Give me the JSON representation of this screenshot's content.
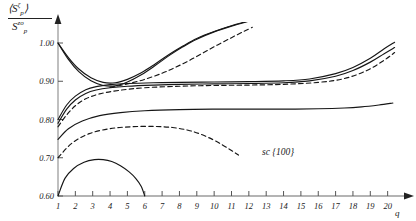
{
  "figure": {
    "annotation": "sc {100}",
    "ylabel": {
      "numerator_base": "S",
      "numerator_sub": "p",
      "numerator_sup": "ζ",
      "denominator_base": "S",
      "denominator_sub": "p",
      "denominator_sup": "zo",
      "bracket_open": "⟨",
      "bracket_close": "⟩"
    },
    "xlabel": "q"
  },
  "chart_data": {
    "type": "line",
    "title": "",
    "xlabel": "q",
    "ylabel": "<S_p^zeta> / S_p^zo",
    "annotation": "sc {100}",
    "xlim": [
      1,
      21
    ],
    "ylim": [
      0.6,
      1.03
    ],
    "xticks": [
      1,
      2,
      3,
      4,
      5,
      6,
      7,
      8,
      9,
      10,
      11,
      12,
      13,
      14,
      15,
      16,
      17,
      18,
      19,
      20
    ],
    "xtick_labels": [
      "1",
      "2",
      "3",
      "4",
      "5",
      "6",
      "7",
      "8",
      "9",
      "10",
      "11",
      "12",
      "13",
      "14",
      "15",
      "16",
      "17",
      "18",
      "19",
      "20"
    ],
    "yticks": [
      0.6,
      0.7,
      0.8,
      0.9,
      1.0
    ],
    "ytick_labels": [
      "0.60",
      "0.70",
      "0.80",
      "0.90",
      "1.00"
    ],
    "grid": false,
    "legend": "none",
    "series": [
      {
        "name": "curve-A-solid-dip-rise",
        "style": "solid",
        "x": [
          1,
          1.6,
          2.2,
          2.9,
          3.6,
          4.3,
          5.0,
          5.8,
          6.6,
          7.4,
          8.2,
          9.0,
          10.0,
          11.0,
          12.0
        ],
        "y": [
          1.0,
          0.962,
          0.932,
          0.909,
          0.897,
          0.896,
          0.905,
          0.922,
          0.945,
          0.97,
          0.992,
          1.012,
          1.03,
          1.045,
          1.058
        ]
      },
      {
        "name": "curve-B-solid-dip-rise-lower",
        "style": "solid",
        "x": [
          1,
          1.6,
          2.2,
          2.9,
          3.6,
          4.3,
          5.0,
          5.8,
          6.6,
          7.4,
          8.2,
          9.0,
          10.0,
          11.0,
          12.0
        ],
        "y": [
          1.0,
          0.957,
          0.925,
          0.901,
          0.889,
          0.888,
          0.898,
          0.917,
          0.941,
          0.967,
          0.99,
          1.01,
          1.029,
          1.044,
          1.057
        ]
      },
      {
        "name": "curve-C-solid-plateau-upturn",
        "style": "solid",
        "x": [
          1,
          1.5,
          2.0,
          2.6,
          3.2,
          4.0,
          5.0,
          6.5,
          8.0,
          10.0,
          12.0,
          14.0,
          15.5,
          17.0,
          18.0,
          19.0,
          19.8,
          20.4
        ],
        "y": [
          0.8,
          0.838,
          0.861,
          0.878,
          0.886,
          0.891,
          0.894,
          0.896,
          0.897,
          0.898,
          0.899,
          0.901,
          0.906,
          0.92,
          0.936,
          0.96,
          0.985,
          1.002
        ]
      },
      {
        "name": "curve-D-solid-plateau-upturn-lower",
        "style": "solid",
        "x": [
          1,
          1.5,
          2.0,
          2.6,
          3.2,
          4.0,
          5.0,
          6.5,
          8.0,
          10.0,
          12.0,
          14.0,
          15.5,
          17.0,
          18.0,
          19.0,
          19.8,
          20.4
        ],
        "y": [
          0.79,
          0.827,
          0.851,
          0.868,
          0.877,
          0.883,
          0.887,
          0.89,
          0.892,
          0.893,
          0.894,
          0.896,
          0.901,
          0.913,
          0.928,
          0.95,
          0.972,
          0.988
        ]
      },
      {
        "name": "curve-E-dashed-mid-plateau",
        "style": "dashed",
        "x": [
          1,
          1.5,
          2.0,
          2.6,
          3.4,
          4.5,
          6.0,
          8.0,
          10.0,
          12.0,
          14.0,
          16.0,
          17.5,
          18.8,
          19.8,
          20.4
        ],
        "y": [
          0.781,
          0.812,
          0.836,
          0.854,
          0.867,
          0.876,
          0.883,
          0.887,
          0.889,
          0.89,
          0.892,
          0.897,
          0.907,
          0.928,
          0.955,
          0.975
        ]
      },
      {
        "name": "curve-F-dashed-steep-rise",
        "style": "dashed",
        "x": [
          4.0,
          5.0,
          6.0,
          7.0,
          7.8,
          8.6,
          9.4,
          10.2,
          11.0,
          11.7,
          12.2
        ],
        "y": [
          0.884,
          0.893,
          0.905,
          0.921,
          0.937,
          0.955,
          0.975,
          0.995,
          1.014,
          1.03,
          1.041
        ]
      },
      {
        "name": "curve-G-solid-low-plateau",
        "style": "solid",
        "x": [
          1,
          1.6,
          2.4,
          3.4,
          4.6,
          6.0,
          8.0,
          10.0,
          12.0,
          14.0,
          16.0,
          17.5,
          18.5,
          19.5,
          20.3
        ],
        "y": [
          0.748,
          0.776,
          0.796,
          0.81,
          0.818,
          0.823,
          0.826,
          0.827,
          0.827,
          0.827,
          0.828,
          0.83,
          0.833,
          0.838,
          0.843
        ]
      },
      {
        "name": "curve-H-dashed-rise-then-fall",
        "style": "dashed",
        "x": [
          1,
          1.8,
          2.8,
          4.0,
          5.2,
          6.5,
          7.6,
          8.5,
          9.2,
          9.9,
          10.5,
          11.0,
          11.4
        ],
        "y": [
          0.7,
          0.738,
          0.763,
          0.776,
          0.781,
          0.782,
          0.779,
          0.772,
          0.762,
          0.748,
          0.733,
          0.719,
          0.707
        ]
      },
      {
        "name": "curve-I-solid-arc",
        "style": "solid",
        "x": [
          1.0,
          1.4,
          1.9,
          2.5,
          3.1,
          3.6,
          4.1,
          4.6,
          5.1,
          5.5,
          5.8,
          6.0
        ],
        "y": [
          0.6,
          0.646,
          0.672,
          0.688,
          0.695,
          0.695,
          0.69,
          0.679,
          0.663,
          0.645,
          0.625,
          0.6
        ]
      }
    ]
  }
}
